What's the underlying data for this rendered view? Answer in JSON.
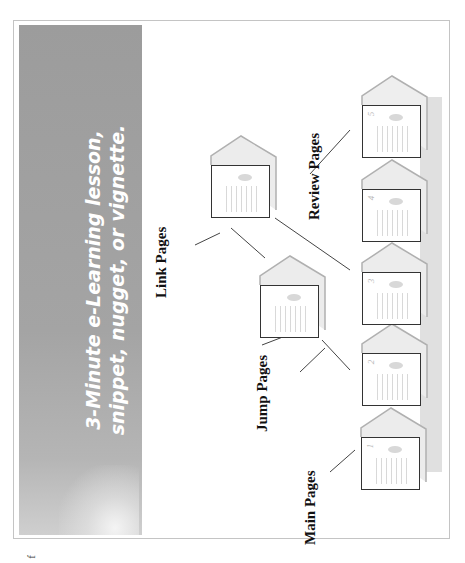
{
  "slide": {
    "title_line1": "3-Minute e-Learning lesson,",
    "title_line2": "snippet, nugget, or vignette.",
    "title_panel_color": "#a0a0a0",
    "title_text_color": "#ffffff"
  },
  "labels": {
    "main": "Main Pages",
    "jump": "Jump Pages",
    "link": "Link Pages",
    "review": "Review Pages"
  },
  "main_pages": [
    {
      "number": "1"
    },
    {
      "number": "2"
    },
    {
      "number": "3"
    },
    {
      "number": "4"
    },
    {
      "number": "5"
    }
  ],
  "branch_pages": [
    {
      "type": "jump"
    },
    {
      "type": "link"
    }
  ],
  "footer": {
    "glyph": "f"
  }
}
